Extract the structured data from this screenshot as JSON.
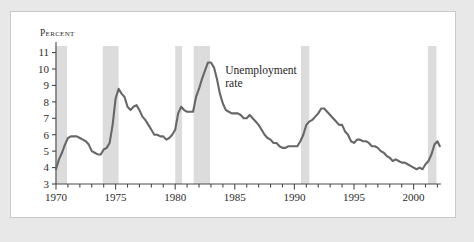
{
  "figure": {
    "axis_title": "Percent",
    "annotation_line1": "Unemployment",
    "annotation_line2": "rate",
    "line_color": "#676767",
    "band_color": "#dcdcdc",
    "axis_color": "#4a4a4a",
    "card_background": "#ffffff",
    "page_background": "#e8e8e8"
  },
  "chart_data": {
    "type": "line",
    "title": "",
    "xlabel": "",
    "ylabel": "Percent",
    "xlim": [
      1970,
      2002.3
    ],
    "ylim": [
      3,
      11.4
    ],
    "grid": false,
    "legend": "inline-annotation",
    "annotations": [
      {
        "text": "Unemployment rate",
        "x": 1984.2,
        "y": 9.7
      }
    ],
    "ytick_labels": [
      "3",
      "4",
      "5",
      "6",
      "7",
      "8",
      "9",
      "10",
      "11"
    ],
    "ytick_values": [
      3,
      4,
      5,
      6,
      7,
      8,
      9,
      10,
      11
    ],
    "xtick_labels": [
      "1970",
      "1975",
      "1980",
      "1985",
      "1990",
      "1995",
      "2000"
    ],
    "xtick_values": [
      1970,
      1975,
      1980,
      1985,
      1990,
      1995,
      2000
    ],
    "xminor_step": 1,
    "shaded_regions_label": "recessions",
    "shaded_regions": [
      {
        "start": 1969.95,
        "end": 1970.92
      },
      {
        "start": 1973.92,
        "end": 1975.25
      },
      {
        "start": 1980.0,
        "end": 1980.58
      },
      {
        "start": 1981.55,
        "end": 1982.92
      },
      {
        "start": 1990.55,
        "end": 1991.25
      },
      {
        "start": 2001.2,
        "end": 2001.92
      }
    ],
    "series": [
      {
        "name": "Unemployment rate",
        "x": [
          1970.0,
          1970.25,
          1970.5,
          1970.75,
          1971.0,
          1971.25,
          1971.5,
          1971.75,
          1972.0,
          1972.25,
          1972.5,
          1972.75,
          1973.0,
          1973.25,
          1973.5,
          1973.75,
          1974.0,
          1974.25,
          1974.5,
          1974.75,
          1975.0,
          1975.25,
          1975.5,
          1975.75,
          1976.0,
          1976.25,
          1976.5,
          1976.75,
          1977.0,
          1977.25,
          1977.5,
          1977.75,
          1978.0,
          1978.25,
          1978.5,
          1978.75,
          1979.0,
          1979.25,
          1979.5,
          1979.75,
          1980.0,
          1980.25,
          1980.5,
          1980.75,
          1981.0,
          1981.25,
          1981.5,
          1981.75,
          1982.0,
          1982.25,
          1982.5,
          1982.75,
          1983.0,
          1983.25,
          1983.5,
          1983.75,
          1984.0,
          1984.25,
          1984.5,
          1984.75,
          1985.0,
          1985.25,
          1985.5,
          1985.75,
          1986.0,
          1986.25,
          1986.5,
          1986.75,
          1987.0,
          1987.25,
          1987.5,
          1987.75,
          1988.0,
          1988.25,
          1988.5,
          1988.75,
          1989.0,
          1989.25,
          1989.5,
          1989.75,
          1990.0,
          1990.25,
          1990.5,
          1990.75,
          1991.0,
          1991.25,
          1991.5,
          1991.75,
          1992.0,
          1992.25,
          1992.5,
          1992.75,
          1993.0,
          1993.25,
          1993.5,
          1993.75,
          1994.0,
          1994.25,
          1994.5,
          1994.75,
          1995.0,
          1995.25,
          1995.5,
          1995.75,
          1996.0,
          1996.25,
          1996.5,
          1996.75,
          1997.0,
          1997.25,
          1997.5,
          1997.75,
          1998.0,
          1998.25,
          1998.5,
          1998.75,
          1999.0,
          1999.25,
          1999.5,
          1999.75,
          2000.0,
          2000.25,
          2000.5,
          2000.75,
          2001.0,
          2001.25,
          2001.5,
          2001.75,
          2002.0,
          2002.2
        ],
        "values": [
          3.9,
          4.5,
          4.9,
          5.4,
          5.8,
          5.9,
          5.9,
          5.9,
          5.8,
          5.7,
          5.6,
          5.4,
          5.0,
          4.9,
          4.8,
          4.8,
          5.1,
          5.2,
          5.5,
          6.6,
          8.2,
          8.8,
          8.5,
          8.3,
          7.7,
          7.5,
          7.7,
          7.8,
          7.5,
          7.1,
          6.9,
          6.6,
          6.3,
          6.0,
          6.0,
          5.9,
          5.9,
          5.7,
          5.8,
          6.0,
          6.3,
          7.3,
          7.7,
          7.5,
          7.4,
          7.4,
          7.4,
          8.3,
          8.8,
          9.4,
          9.9,
          10.4,
          10.4,
          10.1,
          9.4,
          8.5,
          7.9,
          7.5,
          7.4,
          7.3,
          7.3,
          7.3,
          7.2,
          7.0,
          7.0,
          7.2,
          7.0,
          6.8,
          6.6,
          6.3,
          6.0,
          5.8,
          5.7,
          5.5,
          5.5,
          5.3,
          5.2,
          5.2,
          5.3,
          5.3,
          5.3,
          5.3,
          5.6,
          6.0,
          6.6,
          6.8,
          6.9,
          7.1,
          7.3,
          7.6,
          7.6,
          7.4,
          7.2,
          7.0,
          6.8,
          6.6,
          6.6,
          6.2,
          6.0,
          5.6,
          5.5,
          5.7,
          5.7,
          5.6,
          5.6,
          5.5,
          5.3,
          5.3,
          5.2,
          5.0,
          4.9,
          4.7,
          4.6,
          4.4,
          4.5,
          4.4,
          4.3,
          4.3,
          4.2,
          4.1,
          4.0,
          3.9,
          4.0,
          3.9,
          4.2,
          4.4,
          4.8,
          5.4,
          5.6,
          5.3
        ]
      }
    ]
  }
}
